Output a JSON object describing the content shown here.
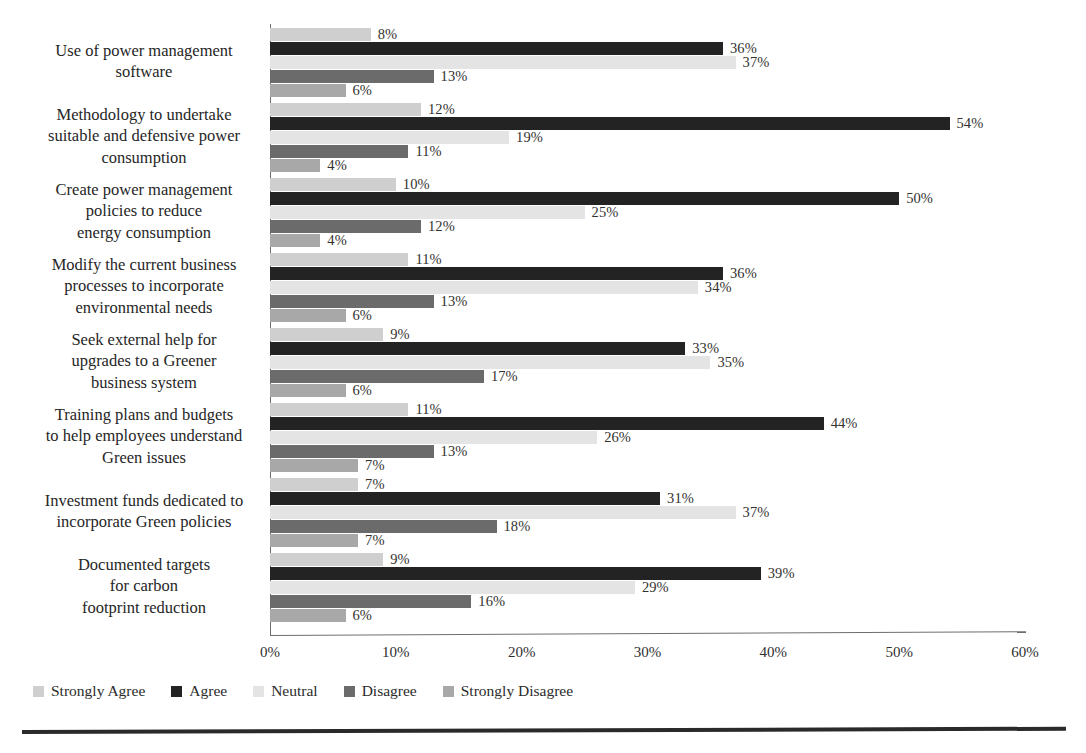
{
  "chart_data": {
    "type": "bar",
    "orientation": "horizontal",
    "title": "",
    "subtitle": "",
    "xlabel": "",
    "ylabel": "",
    "xlim": [
      0,
      60
    ],
    "xticks": [
      "0%",
      "10%",
      "20%",
      "30%",
      "40%",
      "50%",
      "60%"
    ],
    "xtick_values": [
      0,
      10,
      20,
      30,
      40,
      50,
      60
    ],
    "grid": false,
    "legend_position": "bottom-left",
    "value_suffix": "%",
    "categories": [
      "Use of power management\nsoftware",
      "Methodology to undertake\nsuitable and defensive power\nconsumption",
      "Create power management\npolicies  to reduce\nenergy consumption",
      "Modify the current business\nprocesses to incorporate\nenvironmental needs",
      "Seek external help for\nupgrades to a Greener\nbusiness system",
      "Training plans and budgets\nto help employees understand\nGreen issues",
      "Investment funds dedicated to\nincorporate Green policies",
      "Documented targets\nfor carbon\nfootprint reduction"
    ],
    "series": [
      {
        "name": "Strongly Agree",
        "color": "#cfcfcf",
        "values": [
          8,
          12,
          10,
          11,
          9,
          11,
          7,
          9
        ],
        "labels": [
          "8%",
          "12%",
          "10%",
          "11%",
          "9%",
          "11%",
          "7%",
          "9%"
        ]
      },
      {
        "name": "Agree",
        "color": "#232323",
        "values": [
          36,
          54,
          50,
          36,
          33,
          44,
          31,
          39
        ],
        "labels": [
          "36%",
          "54%",
          "50%",
          "36%",
          "33%",
          "44%",
          "31%",
          "39%"
        ]
      },
      {
        "name": "Neutral",
        "color": "#e4e4e4",
        "values": [
          37,
          19,
          25,
          34,
          35,
          26,
          37,
          29
        ],
        "labels": [
          "37%",
          "19%",
          "25%",
          "34%",
          "35%",
          "26%",
          "37%",
          "29%"
        ]
      },
      {
        "name": "Disagree",
        "color": "#6b6b6b",
        "values": [
          13,
          11,
          12,
          13,
          17,
          13,
          18,
          16
        ],
        "labels": [
          "13%",
          "11%",
          "12%",
          "13%",
          "17%",
          "13%",
          "18%",
          "16%"
        ]
      },
      {
        "name": "Strongly Disagree",
        "color": "#a8a8a8",
        "values": [
          6,
          4,
          4,
          6,
          6,
          7,
          7,
          6
        ],
        "labels": [
          "6%",
          "4%",
          "4%",
          "6%",
          "6%",
          "7%",
          "7%",
          "6%"
        ]
      }
    ]
  }
}
